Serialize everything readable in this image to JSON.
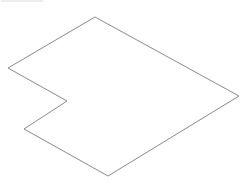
{
  "diagram": {
    "type": "isometric-outline",
    "shape": "L-shaped plan outline (isometric projection)",
    "stroke_color": "#8a8a8a",
    "stroke_width": 1,
    "background": "#ffffff",
    "vertices": [
      {
        "name": "top",
        "x": 95,
        "y": 17
      },
      {
        "name": "right",
        "x": 239,
        "y": 96
      },
      {
        "name": "bottom",
        "x": 108,
        "y": 176
      },
      {
        "name": "lower-left",
        "x": 24,
        "y": 129
      },
      {
        "name": "notch-inner",
        "x": 67,
        "y": 101
      },
      {
        "name": "left",
        "x": 8,
        "y": 68
      }
    ],
    "points": "95,17 239,96 108,176 24,129 67,101 8,68"
  }
}
